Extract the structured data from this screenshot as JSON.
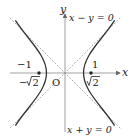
{
  "diagram": {
    "type": "hyperbola",
    "equation": "x^2 - y^2 = 1",
    "axes": {
      "x_label": "x",
      "y_label": "y",
      "origin_label": "O"
    },
    "asymptotes": [
      {
        "label": "x − y = 0"
      },
      {
        "label": "x + y = 0"
      }
    ],
    "vertices": [
      {
        "label": "−1"
      },
      {
        "label": "1"
      }
    ],
    "foci": [
      {
        "label_prefix": "−",
        "label_root": "2"
      },
      {
        "label_prefix": "",
        "label_root": "2"
      }
    ],
    "colors": {
      "curve": "#333333",
      "axis": "#888888",
      "asymptote": "#9a9a9a",
      "text": "#222222"
    }
  }
}
